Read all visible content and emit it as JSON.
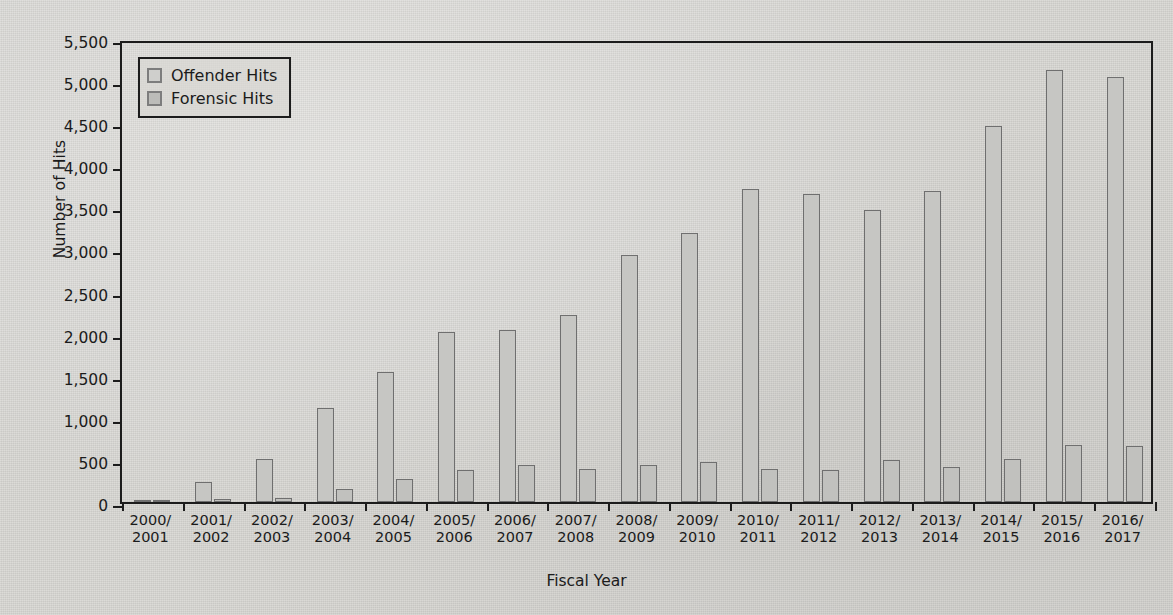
{
  "chart_data": {
    "type": "bar",
    "title": "",
    "xlabel": "Fiscal Year",
    "ylabel": "Number of Hits",
    "ylim": [
      0,
      5500
    ],
    "ytick_step": 500,
    "yticks": [
      "0",
      "500",
      "1,000",
      "1,500",
      "2,000",
      "2,500",
      "3,000",
      "3,500",
      "4,000",
      "4,500",
      "5,000",
      "5,500"
    ],
    "ytick_values": [
      0,
      500,
      1000,
      1500,
      2000,
      2500,
      3000,
      3500,
      4000,
      4500,
      5000,
      5500
    ],
    "grid": false,
    "legend_position": "top-left-inside",
    "categories": [
      "2000/\n2001",
      "2001/\n2002",
      "2002/\n2003",
      "2003/\n2004",
      "2004/\n2005",
      "2005/\n2006",
      "2006/\n2007",
      "2007/\n2008",
      "2008/\n2009",
      "2009/\n2010",
      "2010/\n2011",
      "2011/\n2012",
      "2012/\n2013",
      "2013/\n2014",
      "2014/\n2015",
      "2015/\n2016",
      "2016/\n2017"
    ],
    "category_lines": [
      [
        "2000/",
        "2001"
      ],
      [
        "2001/",
        "2002"
      ],
      [
        "2002/",
        "2003"
      ],
      [
        "2003/",
        "2004"
      ],
      [
        "2004/",
        "2005"
      ],
      [
        "2005/",
        "2006"
      ],
      [
        "2006/",
        "2007"
      ],
      [
        "2007/",
        "2008"
      ],
      [
        "2008/",
        "2009"
      ],
      [
        "2009/",
        "2010"
      ],
      [
        "2010/",
        "2011"
      ],
      [
        "2011/",
        "2012"
      ],
      [
        "2012/",
        "2013"
      ],
      [
        "2013/",
        "2014"
      ],
      [
        "2014/",
        "2015"
      ],
      [
        "2015/",
        "2016"
      ],
      [
        "2016/",
        "2017"
      ]
    ],
    "series": [
      {
        "name": "Offender Hits",
        "color": "#c6c6c3",
        "values": [
          20,
          240,
          510,
          1120,
          1540,
          2020,
          2040,
          2220,
          2930,
          3200,
          3720,
          3660,
          3470,
          3690,
          4470,
          5130,
          5050
        ]
      },
      {
        "name": "Forensic Hits",
        "color": "#c1c1be",
        "values": [
          10,
          30,
          50,
          150,
          270,
          380,
          440,
          390,
          440,
          470,
          390,
          380,
          500,
          420,
          510,
          680,
          660
        ]
      }
    ]
  },
  "legend": {
    "items": [
      {
        "label": "Offender Hits",
        "swatch": "offender"
      },
      {
        "label": "Forensic Hits",
        "swatch": "forensic"
      }
    ]
  }
}
